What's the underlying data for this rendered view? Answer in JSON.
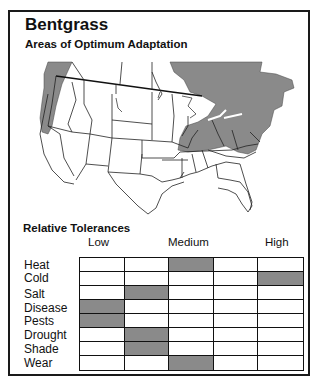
{
  "title": "Bentgrass",
  "map": {
    "heading": "Areas of Optimum Adaptation",
    "shaded_regions": [
      "Pacific Northwest coast",
      "Great Lakes region",
      "Northeastern United States",
      "Eastern Canada"
    ],
    "shade_color": "#8a8a8a"
  },
  "tolerances": {
    "heading": "Relative Tolerances",
    "levels": [
      "Low",
      "Medium",
      "High"
    ],
    "columns": 5,
    "rows": [
      {
        "label": "Heat",
        "level_index": 2
      },
      {
        "label": "Cold",
        "level_index": 4
      },
      {
        "label": "Salt",
        "level_index": 1
      },
      {
        "label": "Disease",
        "level_index": 0
      },
      {
        "label": "Pests",
        "level_index": 0
      },
      {
        "label": "Drought",
        "level_index": 1
      },
      {
        "label": "Shade",
        "level_index": 1
      },
      {
        "label": "Wear",
        "level_index": 2
      }
    ],
    "fill_color": "#8a8a8a"
  }
}
